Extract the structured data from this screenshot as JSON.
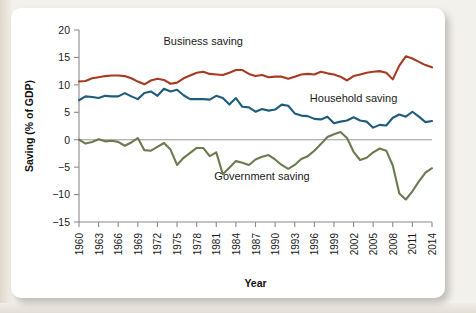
{
  "figure": {
    "background_color": "#ffffff",
    "page_color": "#f3f1ec"
  },
  "chart_data": {
    "type": "line",
    "title": "",
    "xlabel": "Year",
    "ylabel": "Saving (% of GDP)",
    "xlim": [
      1960,
      2014
    ],
    "ylim": [
      -15,
      20
    ],
    "ytick_labels": [
      "20",
      "15",
      "10",
      "5",
      "0",
      "−5",
      "−10",
      "−15"
    ],
    "ytick_values": [
      20,
      15,
      10,
      5,
      0,
      -5,
      -10,
      -15
    ],
    "xtick_labels": [
      "1960",
      "1963",
      "1966",
      "1969",
      "1972",
      "1975",
      "1978",
      "1981",
      "1984",
      "1987",
      "1990",
      "1993",
      "1996",
      "1999",
      "2002",
      "2005",
      "2008",
      "2011",
      "2014"
    ],
    "xtick_values": [
      1960,
      1963,
      1966,
      1969,
      1972,
      1975,
      1978,
      1981,
      1984,
      1987,
      1990,
      1993,
      1996,
      1999,
      2002,
      2005,
      2008,
      2011,
      2014
    ],
    "grid": false,
    "legend_position": "inline-annotations",
    "zero_line": true,
    "x": [
      1960,
      1961,
      1962,
      1963,
      1964,
      1965,
      1966,
      1967,
      1968,
      1969,
      1970,
      1971,
      1972,
      1973,
      1974,
      1975,
      1976,
      1977,
      1978,
      1979,
      1980,
      1981,
      1982,
      1983,
      1984,
      1985,
      1986,
      1987,
      1988,
      1989,
      1990,
      1991,
      1992,
      1993,
      1994,
      1995,
      1996,
      1997,
      1998,
      1999,
      2000,
      2001,
      2002,
      2003,
      2004,
      2005,
      2006,
      2007,
      2008,
      2009,
      2010,
      2011,
      2012,
      2013,
      2014
    ],
    "series": [
      {
        "name": "Business saving",
        "color": "#A63A23",
        "label_x": 1979,
        "label_y": 17.3,
        "values": [
          10.6,
          10.7,
          11.2,
          11.4,
          11.6,
          11.7,
          11.7,
          11.6,
          11.2,
          10.6,
          10.1,
          10.8,
          11.1,
          10.9,
          10.2,
          10.4,
          11.2,
          11.7,
          12.2,
          12.4,
          12.0,
          11.9,
          11.8,
          12.2,
          12.7,
          12.7,
          12.0,
          11.6,
          11.8,
          11.4,
          11.5,
          11.5,
          11.1,
          11.5,
          11.9,
          12.0,
          11.9,
          12.4,
          12.1,
          11.9,
          11.5,
          10.8,
          11.6,
          11.9,
          12.2,
          12.4,
          12.5,
          12.2,
          11.0,
          13.5,
          15.2,
          14.8,
          14.2,
          13.6,
          13.2
        ]
      },
      {
        "name": "Household saving",
        "color": "#1F5C7A",
        "label_x": 2002,
        "label_y": 6.8,
        "values": [
          7.2,
          7.9,
          7.8,
          7.6,
          8.0,
          7.9,
          7.9,
          8.5,
          7.9,
          7.4,
          8.5,
          8.8,
          8.0,
          9.3,
          8.8,
          9.1,
          8.1,
          7.4,
          7.4,
          7.4,
          7.3,
          8.0,
          7.6,
          6.4,
          7.6,
          6.0,
          5.9,
          5.1,
          5.6,
          5.3,
          5.5,
          6.4,
          6.2,
          4.8,
          4.4,
          4.3,
          3.8,
          3.7,
          4.2,
          3.0,
          3.3,
          3.5,
          4.1,
          3.5,
          3.3,
          2.2,
          2.7,
          2.6,
          4.0,
          4.6,
          4.2,
          5.1,
          4.2,
          3.2,
          3.4
        ]
      },
      {
        "name": "Government saving",
        "color": "#6B7A50",
        "label_x": 1988,
        "label_y": -7.4,
        "values": [
          0.0,
          -0.7,
          -0.4,
          0.1,
          -0.3,
          -0.2,
          -0.4,
          -1.1,
          -0.5,
          0.3,
          -1.9,
          -2.0,
          -1.3,
          -0.6,
          -1.8,
          -4.6,
          -3.3,
          -2.4,
          -1.5,
          -1.5,
          -3.0,
          -2.3,
          -6.3,
          -5.1,
          -3.9,
          -4.2,
          -4.6,
          -3.6,
          -3.1,
          -2.8,
          -3.6,
          -4.6,
          -5.3,
          -4.6,
          -3.5,
          -3.0,
          -2.0,
          -0.8,
          0.5,
          1.0,
          1.4,
          0.3,
          -2.2,
          -3.7,
          -3.3,
          -2.3,
          -1.6,
          -2.0,
          -4.7,
          -9.8,
          -10.9,
          -9.4,
          -7.6,
          -6.0,
          -5.2
        ]
      }
    ]
  },
  "annotations": {
    "business_label": "Business saving",
    "household_label": "Household saving",
    "government_label": "Government saving"
  }
}
